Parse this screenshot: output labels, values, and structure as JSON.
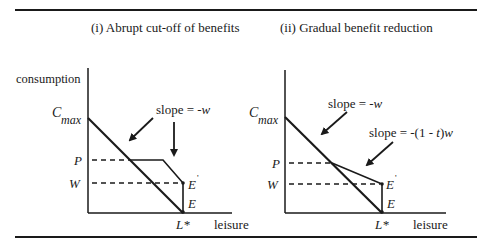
{
  "figure": {
    "panels": [
      {
        "title": "(i) Abrupt cut-off of benefits",
        "y_axis_label": "consumption",
        "x_axis_label": "leisure",
        "labels": {
          "cmax_main": "C",
          "cmax_sub": "max",
          "p": "P",
          "w": "W",
          "e_prime": "E",
          "prime": "'",
          "e": "E",
          "lstar": "L*"
        },
        "annotations": [
          "slope = -w"
        ]
      },
      {
        "title": "(ii) Gradual benefit reduction",
        "y_axis_label": "",
        "x_axis_label": "leisure",
        "labels": {
          "cmax_main": "C",
          "cmax_sub": "max",
          "p": "P",
          "w": "W",
          "e_prime": "E",
          "prime": "'",
          "e": "E",
          "lstar": "L*"
        },
        "annotations": [
          "slope = -w",
          "slope = -(1 - t)w"
        ]
      }
    ]
  }
}
